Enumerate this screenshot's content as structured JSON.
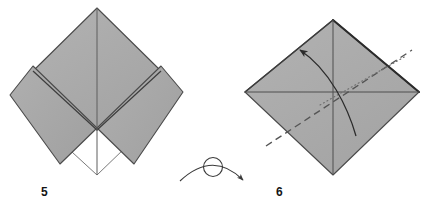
{
  "document": {
    "kind": "origami-instruction-diagram",
    "background_color": "#ffffff",
    "width": 423,
    "height": 208
  },
  "palette": {
    "paper_front": "#aaaaaa",
    "paper_front_shade": "#a2a2a2",
    "paper_back": "#ffffff",
    "outline": "#4a4a4a",
    "outline_dark": "#2b2b2b",
    "crease_line": "#5a5a5a",
    "dash_line": "#555555",
    "dot_line": "#777777",
    "arrow": "#2b2b2b",
    "label_text": "#141414"
  },
  "steps": [
    {
      "id": "step-5",
      "number": "5",
      "label_position": {
        "x": 41,
        "y": 186
      },
      "description": "Folded square with two side flaps brought to the center; lower-center area shows the white reverse side of the paper.",
      "shape": {
        "type": "diamond",
        "top": {
          "x": 97,
          "y": 8
        },
        "right": {
          "x": 183,
          "y": 92
        },
        "bottom": {
          "x": 97,
          "y": 175
        },
        "left": {
          "x": 10,
          "y": 95
        },
        "center": {
          "x": 97,
          "y": 130
        }
      },
      "creases": [
        {
          "name": "vertical-center-crease",
          "from": {
            "x": 97,
            "y": 8
          },
          "to": {
            "x": 97,
            "y": 175
          },
          "style": "solid"
        }
      ],
      "flaps": [
        {
          "name": "left-flap",
          "side": "left"
        },
        {
          "name": "right-flap",
          "side": "right"
        },
        {
          "name": "upper-panel",
          "side": "top"
        }
      ]
    },
    {
      "id": "step-6",
      "number": "6",
      "label_position": {
        "x": 276,
        "y": 186
      },
      "description": "Square turned over, showing existing creases plus a valley-fold line and a fold-over arrow.",
      "shape": {
        "type": "diamond",
        "top": {
          "x": 333,
          "y": 20
        },
        "right": {
          "x": 419,
          "y": 92
        },
        "bottom": {
          "x": 333,
          "y": 175
        },
        "left": {
          "x": 245,
          "y": 92
        },
        "center": {
          "x": 333,
          "y": 97
        }
      },
      "creases": [
        {
          "name": "vertical-crease",
          "from": {
            "x": 333,
            "y": 20
          },
          "to": {
            "x": 333,
            "y": 175
          },
          "style": "solid"
        },
        {
          "name": "horizontal-crease",
          "from": {
            "x": 245,
            "y": 92
          },
          "to": {
            "x": 419,
            "y": 92
          },
          "style": "solid"
        },
        {
          "name": "valley-fold-line",
          "from": {
            "x": 268,
            "y": 144
          },
          "to": {
            "x": 412,
            "y": 50
          },
          "style": "dashed"
        },
        {
          "name": "reference-line",
          "from": {
            "x": 320,
            "y": 104
          },
          "to": {
            "x": 404,
            "y": 57
          },
          "style": "dotted"
        }
      ],
      "arrows": [
        {
          "name": "fold-arrow",
          "type": "curved-solid",
          "from": {
            "x": 356,
            "y": 136
          },
          "to": {
            "x": 296,
            "y": 47
          },
          "direction": "up-left"
        }
      ]
    }
  ],
  "turn_over_symbol": {
    "name": "turn-over-symbol",
    "meaning": "Turn the model over",
    "arc": {
      "start": {
        "x": 180,
        "y": 181
      },
      "end": {
        "x": 247,
        "y": 182
      },
      "apex": {
        "x": 213,
        "y": 160
      }
    },
    "loop": {
      "cx": 213,
      "cy": 166,
      "r": 9
    },
    "arrowhead_at": "end"
  }
}
